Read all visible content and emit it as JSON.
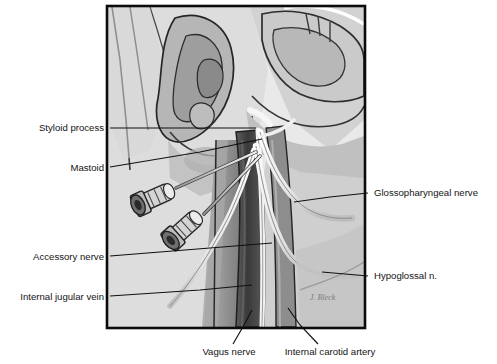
{
  "figure": {
    "artist_signature": "J. Bleck",
    "frame": {
      "x": 107,
      "y": 6,
      "width": 258,
      "height": 322,
      "border_color": "#0b0b0b"
    }
  },
  "palette": {
    "page_background": "#ffffff",
    "plate_background": "#e9e9e9",
    "skin_light": "#dcdcdc",
    "skin_mid": "#c6c6c6",
    "skin_shadow": "#a9a9a9",
    "muscle_mid": "#9a9a9a",
    "muscle_dark": "#6e6e6e",
    "vein_dark": "#4a4a4a",
    "vein_darkest": "#303030",
    "artery_mid": "#8b8b8b",
    "nerve_white": "#fbfbfb",
    "needle_steel": "#d8d8d8",
    "outline": "#1a1a1a",
    "label_text": "#141414",
    "leader_line": "#101010"
  },
  "labels": [
    {
      "id": "styloid-process",
      "text": "Styloid process",
      "side": "left",
      "text_x": 104,
      "text_y": 131,
      "leader": "M110,128 L183,128 L256,128"
    },
    {
      "id": "mastoid",
      "text": "Mastoid",
      "side": "left",
      "text_x": 104,
      "text_y": 171,
      "leader": "M110,167 L200,152 L262,139"
    },
    {
      "id": "accessory-nerve",
      "text": "Accessory nerve",
      "side": "left",
      "text_x": 104,
      "text_y": 260,
      "leader": "M110,256 L210,248 L272,243"
    },
    {
      "id": "internal-jugular-vein",
      "text": "Internal jugular vein",
      "side": "left",
      "text_x": 104,
      "text_y": 300,
      "leader": "M110,296 L200,290 L252,285"
    },
    {
      "id": "glossopharyngeal-nerve",
      "text": "Glossopharyngeal nerve",
      "side": "right",
      "text_x": 374,
      "text_y": 196,
      "leader": "M368,193 L330,197 L294,202"
    },
    {
      "id": "hypoglossal-nerve",
      "text": "Hypoglossal n.",
      "side": "right",
      "text_x": 374,
      "text_y": 279,
      "leader": "M368,276 L345,274 L322,272"
    },
    {
      "id": "vagus-nerve",
      "text": "Vagus nerve",
      "side": "bottom",
      "text_x": 229,
      "text_y": 355,
      "leader": "M233,344 L244,325 L252,310"
    },
    {
      "id": "internal-carotid-artery",
      "text": "Internal carotid artery",
      "side": "bottom",
      "text_x": 330,
      "text_y": 355,
      "leader": "M318,344 L300,325 L288,308"
    }
  ],
  "structures": [
    {
      "id": "auricle",
      "name": "ear-auricle"
    },
    {
      "id": "mandible",
      "name": "mandible-ramus"
    },
    {
      "id": "sternocleidomastoid",
      "name": "sternocleidomastoid-muscle"
    },
    {
      "id": "internal-jugular-vein",
      "name": "internal-jugular-vein"
    },
    {
      "id": "internal-carotid-artery",
      "name": "internal-carotid-artery"
    },
    {
      "id": "vagus-nerve",
      "name": "vagus-nerve"
    },
    {
      "id": "glossopharyngeal-nerve",
      "name": "glossopharyngeal-nerve"
    },
    {
      "id": "hypoglossal-nerve",
      "name": "hypoglossal-nerve"
    },
    {
      "id": "accessory-nerve",
      "name": "accessory-nerve"
    },
    {
      "id": "needle-upper",
      "name": "needle-syringe-upper"
    },
    {
      "id": "needle-lower",
      "name": "needle-syringe-lower"
    }
  ]
}
